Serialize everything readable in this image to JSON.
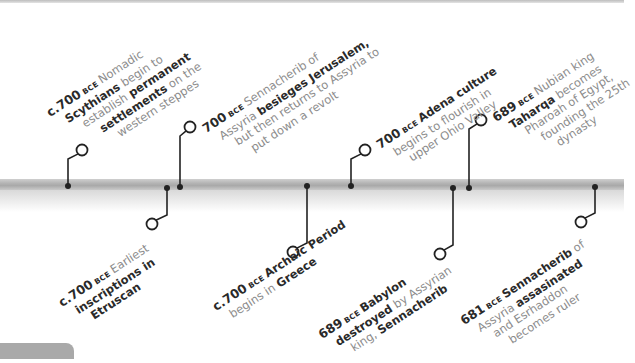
{
  "colors": {
    "connector": "#222222",
    "timeline_bar": "#b0b0b0",
    "body_text": "#8c8c8c",
    "bold_text": "#2a2a2a"
  },
  "events": [
    {
      "id": "scythians",
      "position": "above",
      "dot": [
        68,
        186
      ],
      "circle": [
        82,
        150
      ],
      "year": "c.700",
      "era": "BCE",
      "lines": [
        [
          {
            "t": "Nomadic",
            "b": false
          }
        ],
        [
          {
            "t": "Scythians",
            "b": true
          },
          {
            "t": " begin to",
            "b": false
          }
        ],
        [
          {
            "t": "establish ",
            "b": false
          },
          {
            "t": "permanent",
            "b": true
          }
        ],
        [
          {
            "t": "settlements",
            "b": true
          },
          {
            "t": " on the",
            "b": false
          }
        ],
        [
          {
            "t": "western steppes",
            "b": false
          }
        ]
      ]
    },
    {
      "id": "jerusalem",
      "position": "above",
      "dot": [
        180,
        187
      ],
      "circle": [
        190,
        127
      ],
      "year": "700",
      "era": "BCE",
      "lines": [
        [
          {
            "t": "Sennacherib of",
            "b": false
          }
        ],
        [
          {
            "t": "Assyria ",
            "b": false
          },
          {
            "t": "besieges Jerusalem,",
            "b": true
          }
        ],
        [
          {
            "t": "but then returns to Assyria to",
            "b": false
          }
        ],
        [
          {
            "t": "put down a revolt",
            "b": false
          }
        ]
      ]
    },
    {
      "id": "adena",
      "position": "above",
      "dot": [
        351,
        186
      ],
      "circle": [
        365,
        150
      ],
      "year": "700",
      "era": "BCE",
      "lines": [
        [
          {
            "t": "Adena culture",
            "b": true
          }
        ],
        [
          {
            "t": "begins to flourish in",
            "b": false
          }
        ],
        [
          {
            "t": "upper Ohio Valley",
            "b": false
          }
        ]
      ]
    },
    {
      "id": "taharqa",
      "position": "above",
      "dot": [
        469,
        188
      ],
      "circle": [
        481,
        120
      ],
      "year": "689",
      "era": "BCE",
      "lines": [
        [
          {
            "t": "Nubian king",
            "b": false
          }
        ],
        [
          {
            "t": "Taharqa",
            "b": true
          },
          {
            "t": " becomes",
            "b": false
          }
        ],
        [
          {
            "t": "Pharoah of Egypt,",
            "b": false
          }
        ],
        [
          {
            "t": "founding the 25th",
            "b": false
          }
        ],
        [
          {
            "t": "dynasty",
            "b": false
          }
        ]
      ]
    },
    {
      "id": "etruscan",
      "position": "below",
      "dot": [
        167,
        188
      ],
      "circle": [
        152,
        224
      ],
      "year": "c.700",
      "era": "BCE",
      "lines": [
        [
          {
            "t": "Earliest",
            "b": false
          }
        ],
        [
          {
            "t": "inscriptions in",
            "b": true
          }
        ],
        [
          {
            "t": "Etruscan",
            "b": true
          }
        ]
      ]
    },
    {
      "id": "greece",
      "position": "below",
      "dot": [
        307,
        186
      ],
      "circle": [
        293,
        252
      ],
      "year": "c.700",
      "era": "BCE",
      "lines": [
        [
          {
            "t": "Archaic Period",
            "b": true
          }
        ],
        [
          {
            "t": "begins in ",
            "b": false
          },
          {
            "t": "Greece",
            "b": true
          }
        ]
      ]
    },
    {
      "id": "babylon",
      "position": "below",
      "dot": [
        453,
        188
      ],
      "circle": [
        440,
        254
      ],
      "year": "689",
      "era": "BCE",
      "lines": [
        [
          {
            "t": "Babylon",
            "b": true
          }
        ],
        [
          {
            "t": "destroyed",
            "b": true
          },
          {
            "t": " by Assyrian",
            "b": false
          }
        ],
        [
          {
            "t": "king, ",
            "b": false
          },
          {
            "t": "Sennacherib",
            "b": true
          }
        ]
      ]
    },
    {
      "id": "sennacherib-assassinated",
      "position": "below",
      "dot": [
        595,
        187
      ],
      "circle": [
        581,
        222
      ],
      "year": "681",
      "era": "BCE",
      "lines": [
        [
          {
            "t": "Sennacherib",
            "b": true
          },
          {
            "t": " of",
            "b": false
          }
        ],
        [
          {
            "t": "Assyria ",
            "b": false
          },
          {
            "t": "assasinated",
            "b": true
          }
        ],
        [
          {
            "t": "and Esrhaddon",
            "b": false
          }
        ],
        [
          {
            "t": "becomes ruler",
            "b": false
          }
        ]
      ]
    }
  ],
  "label_layout": {
    "scythians": {
      "x": 44,
      "y": 108,
      "first_line_prefix": true,
      "indent": 12
    },
    "jerusalem": {
      "x": 200,
      "y": 124,
      "indent": 10
    },
    "adena": {
      "x": 374,
      "y": 140,
      "indent": 10
    },
    "taharqa": {
      "x": 490,
      "y": 113,
      "indent": 10
    },
    "etruscan": {
      "x": 56,
      "y": 298,
      "indent": 10
    },
    "greece": {
      "x": 210,
      "y": 302,
      "indent": 10
    },
    "babylon": {
      "x": 316,
      "y": 330,
      "indent": 10
    },
    "sennacherib-assassinated": {
      "x": 458,
      "y": 316,
      "indent": 10
    }
  }
}
